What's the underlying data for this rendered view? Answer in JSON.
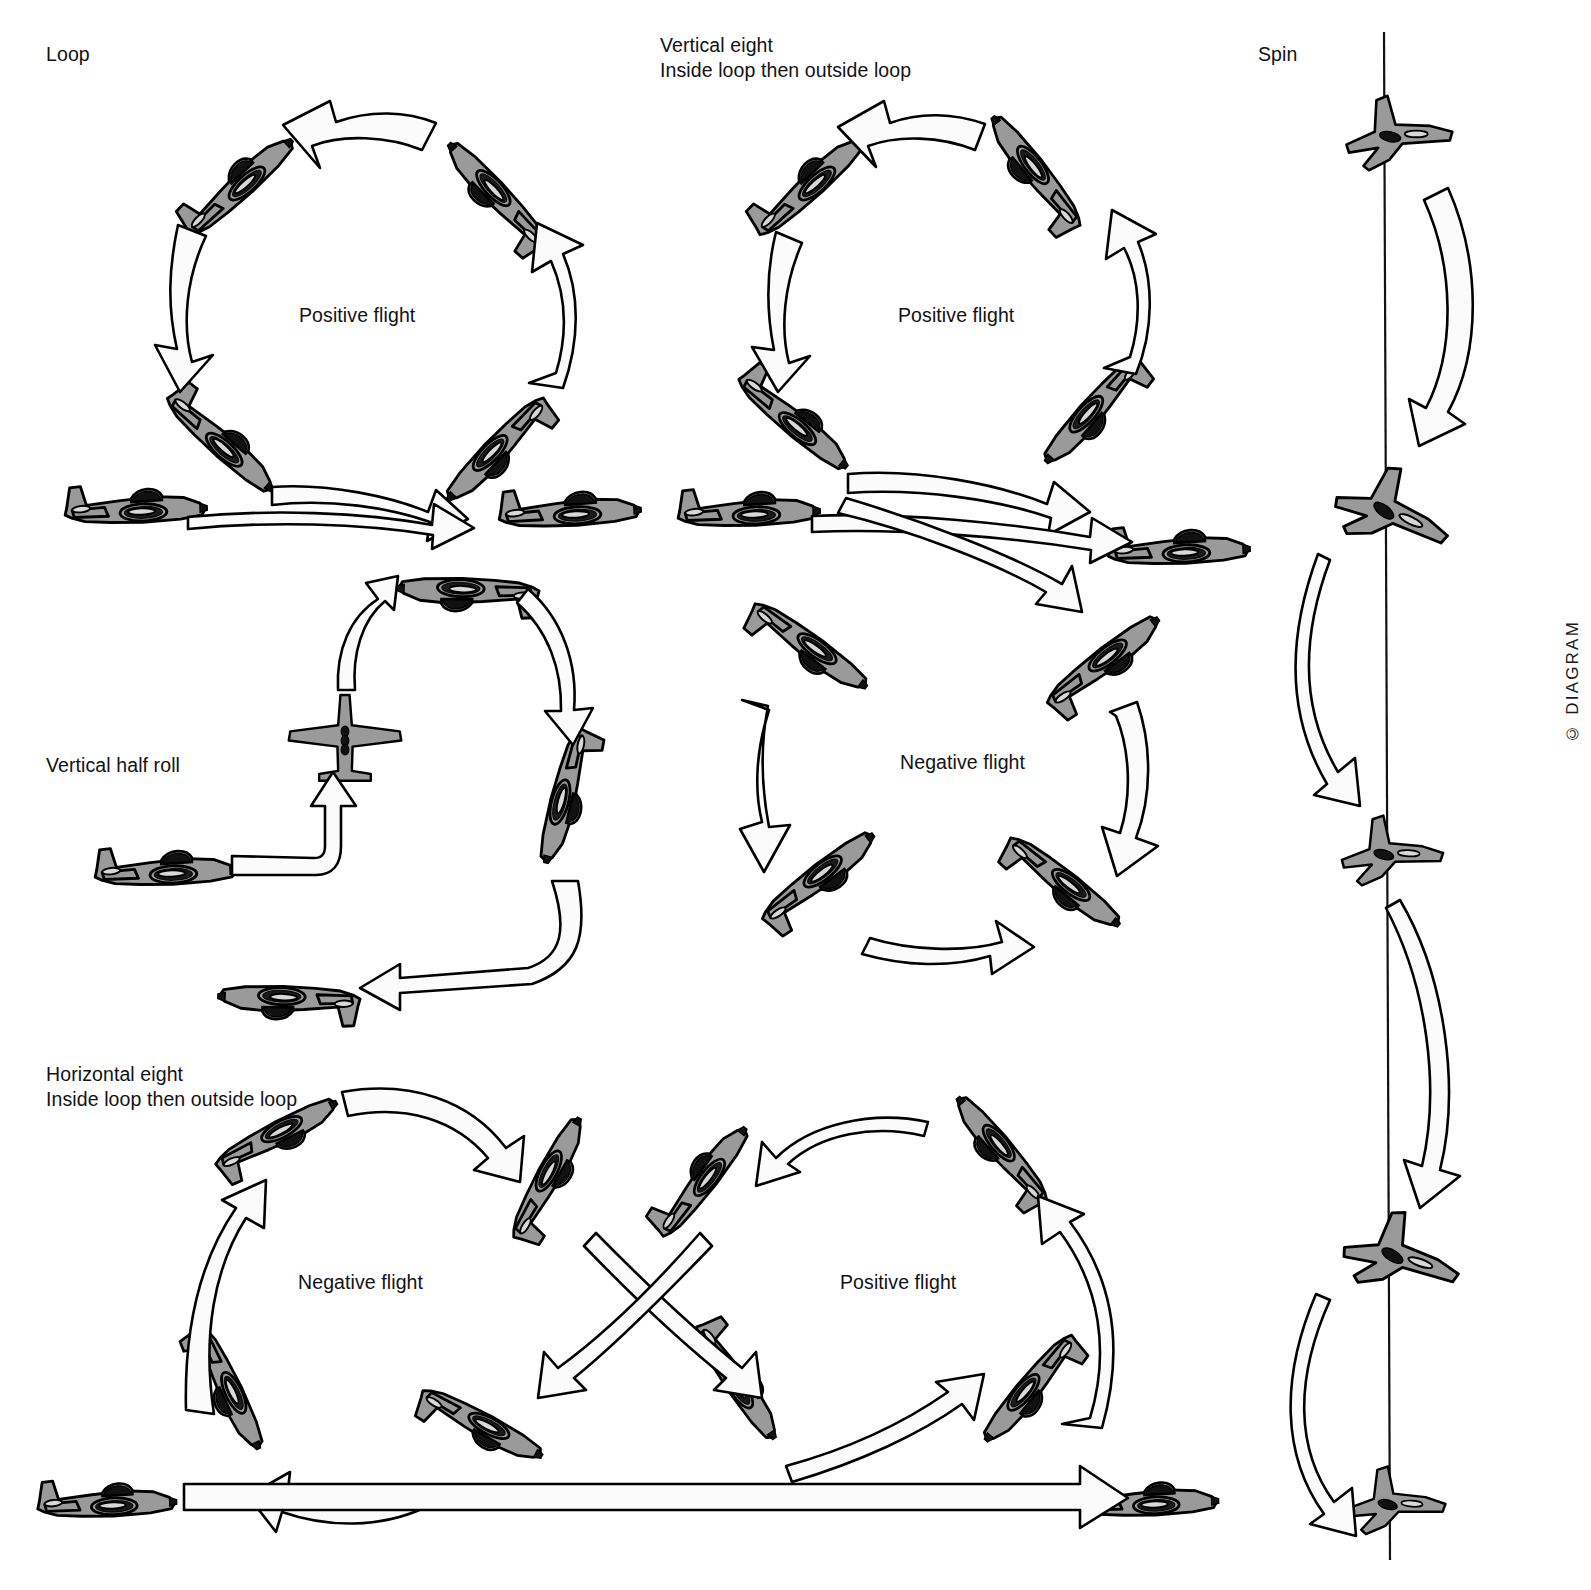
{
  "page": {
    "background": "#ffffff",
    "ink": "#121212",
    "aircraft_fill": "#9a9a9a",
    "arrow_fill": "#fbfbfb",
    "width": 1591,
    "height": 1590
  },
  "sections": {
    "loop": {
      "title": "Loop",
      "inner_label": "Positive flight",
      "aircraft_count": 6,
      "arrow_count": 4
    },
    "vertical_half_roll": {
      "title": "Vertical half roll",
      "inner_label": "",
      "aircraft_count": 5,
      "arrow_count": 4
    },
    "horizontal_eight": {
      "title_line1": "Horizontal eight",
      "title_line2": "Inside loop then outside loop",
      "left_label": "Negative flight",
      "right_label": "Positive flight",
      "aircraft_count": 12,
      "arrow_count": 8
    },
    "vertical_eight": {
      "title_line1": "Vertical eight",
      "title_line2": "Inside loop then outside loop",
      "top_label": "Positive flight",
      "bottom_label": "Negative flight",
      "aircraft_count": 14,
      "arrow_count": 9
    },
    "spin": {
      "title": "Spin",
      "inner_label": "",
      "aircraft_count": 5,
      "arrow_count": 4,
      "axis": "vertical spin axis line"
    }
  },
  "credit": "© DIAGRAM"
}
